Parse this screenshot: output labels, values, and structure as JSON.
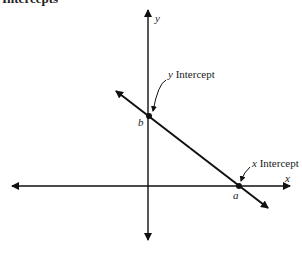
{
  "title": "Intercepts",
  "axes": {
    "x_label": "x",
    "y_label": "y"
  },
  "points": {
    "y_intercept": {
      "symbol": "b",
      "label_var": "y",
      "label_text": " Intercept"
    },
    "x_intercept": {
      "symbol": "a",
      "label_var": "x",
      "label_text": " Intercept"
    }
  },
  "colors": {
    "stroke": "#111111",
    "text": "#222222"
  }
}
